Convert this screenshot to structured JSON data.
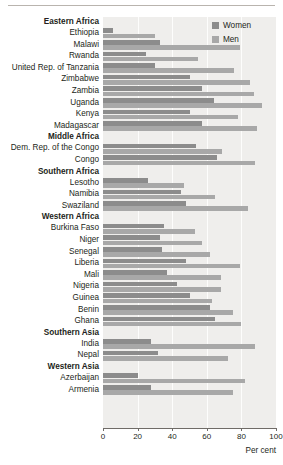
{
  "chart_data": {
    "type": "bar",
    "orientation": "horizontal",
    "grouped": true,
    "title": "",
    "xlabel": "Per cent",
    "ylabel": "",
    "xlim": [
      0,
      100
    ],
    "xticks": [
      0,
      20,
      40,
      60,
      80,
      100
    ],
    "xtick_labels": [
      "0",
      "20",
      "40",
      "60",
      "80",
      "100"
    ],
    "grid": true,
    "legend_position": "top-right",
    "series": [
      {
        "name": "Women",
        "color": "#8c8c8c"
      },
      {
        "name": "Men",
        "color": "#a8a8a8"
      }
    ],
    "rows": [
      {
        "label": "Eastern Africa",
        "type": "group"
      },
      {
        "label": "Ethiopia",
        "type": "data",
        "women": 6,
        "men": 30
      },
      {
        "label": "Malawi",
        "type": "data",
        "women": 33,
        "men": 79
      },
      {
        "label": "Rwanda",
        "type": "data",
        "women": 25,
        "men": 55
      },
      {
        "label": "United Rep. of Tanzania",
        "type": "data",
        "women": 30,
        "men": 76
      },
      {
        "label": "Zimbabwe",
        "type": "data",
        "women": 50,
        "men": 85
      },
      {
        "label": "Zambia",
        "type": "data",
        "women": 57,
        "men": 87
      },
      {
        "label": "Uganda",
        "type": "data",
        "women": 64,
        "men": 92
      },
      {
        "label": "Kenya",
        "type": "data",
        "women": 50,
        "men": 78
      },
      {
        "label": "Madagascar",
        "type": "data",
        "women": 57,
        "men": 89
      },
      {
        "label": "Middle Africa",
        "type": "group"
      },
      {
        "label": "Dem. Rep. of the Congo",
        "type": "data",
        "women": 54,
        "men": 69
      },
      {
        "label": "Congo",
        "type": "data",
        "women": 66,
        "men": 88
      },
      {
        "label": "Southern Africa",
        "type": "group"
      },
      {
        "label": "Lesotho",
        "type": "data",
        "women": 26,
        "men": 47
      },
      {
        "label": "Namibia",
        "type": "data",
        "women": 45,
        "men": 65
      },
      {
        "label": "Swaziland",
        "type": "data",
        "women": 48,
        "men": 84
      },
      {
        "label": "Western Africa",
        "type": "group"
      },
      {
        "label": "Burkina Faso",
        "type": "data",
        "women": 35,
        "men": 53
      },
      {
        "label": "Niger",
        "type": "data",
        "women": 33,
        "men": 57
      },
      {
        "label": "Senegal",
        "type": "data",
        "women": 34,
        "men": 62
      },
      {
        "label": "Liberia",
        "type": "data",
        "women": 48,
        "men": 79
      },
      {
        "label": "Mali",
        "type": "data",
        "women": 37,
        "men": 68
      },
      {
        "label": "Nigeria",
        "type": "data",
        "women": 43,
        "men": 68
      },
      {
        "label": "Guinea",
        "type": "data",
        "women": 50,
        "men": 63
      },
      {
        "label": "Benin",
        "type": "data",
        "women": 62,
        "men": 75
      },
      {
        "label": "Ghana",
        "type": "data",
        "women": 65,
        "men": 80
      },
      {
        "label": "Southern Asia",
        "type": "group"
      },
      {
        "label": "India",
        "type": "data",
        "women": 28,
        "men": 88
      },
      {
        "label": "Nepal",
        "type": "data",
        "women": 32,
        "men": 72
      },
      {
        "label": "Western Asia",
        "type": "group"
      },
      {
        "label": "Azerbaijan",
        "type": "data",
        "women": 20,
        "men": 82
      },
      {
        "label": "Armenia",
        "type": "data",
        "women": 28,
        "men": 75
      }
    ]
  },
  "legend": {
    "women_label": "Women",
    "men_label": "Men"
  },
  "axis": {
    "title": "Per cent"
  }
}
